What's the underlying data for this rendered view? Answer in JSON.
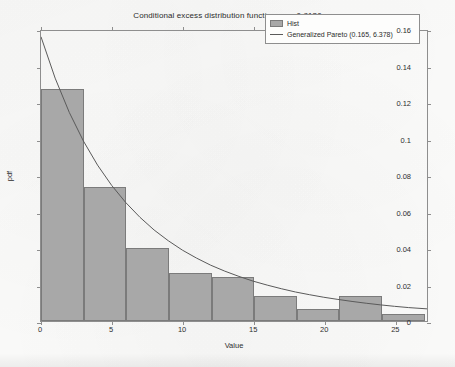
{
  "chart_data": {
    "type": "bar",
    "title_main": "Conditional excess distribution function, p",
    "title_subscript": "val",
    "title_tail": "=0.8130",
    "xlabel": "Value",
    "ylabel": "pdf",
    "xlim": [
      0,
      27.3
    ],
    "ylim": [
      0,
      0.16
    ],
    "xticks": [
      0,
      5,
      10,
      15,
      20,
      25
    ],
    "xtick_labels": [
      "0",
      "5",
      "10",
      "15",
      "20",
      "25"
    ],
    "yticks": [
      0,
      0.02,
      0.04,
      0.06,
      0.08,
      0.1,
      0.12,
      0.14,
      0.16
    ],
    "ytick_labels": [
      "0",
      "0.02",
      "0.04",
      "0.06",
      "0.08",
      "0.1",
      "0.12",
      "0.14",
      "0.16"
    ],
    "grid": false,
    "legend_position": "top-right",
    "bin_width": 3,
    "categories": [
      "0-3",
      "3-6",
      "6-9",
      "9-12",
      "12-15",
      "15-18",
      "18-21",
      "21-24",
      "24-27"
    ],
    "bin_edges": [
      0,
      3,
      6,
      9,
      12,
      15,
      18,
      21,
      24,
      27
    ],
    "values": [
      0.127,
      0.0735,
      0.04,
      0.0265,
      0.024,
      0.0135,
      0.0067,
      0.0135,
      0.004
    ],
    "series": [
      {
        "name": "Hist",
        "type": "bar",
        "color": "#a8a8a8",
        "edge_color": "#7b7b7b",
        "values": [
          0.127,
          0.0735,
          0.04,
          0.0265,
          0.024,
          0.0135,
          0.0067,
          0.0135,
          0.004
        ]
      },
      {
        "name": "Generalized Pareto (0.165, 6.378)",
        "type": "line",
        "color": "#5a5a5a",
        "shape_k": 0.165,
        "scale_sigma": 6.378,
        "x": [
          0,
          1,
          2,
          3,
          4,
          5,
          6,
          7,
          8,
          9,
          10,
          11,
          12,
          13,
          14,
          15,
          16,
          17,
          18,
          19,
          20,
          21,
          22,
          23,
          24,
          25,
          26,
          27.3
        ],
        "y": [
          0.1568,
          0.134,
          0.1151,
          0.0993,
          0.086,
          0.0748,
          0.0653,
          0.0572,
          0.0502,
          0.0443,
          0.0391,
          0.0347,
          0.0308,
          0.0275,
          0.0246,
          0.022,
          0.0198,
          0.0178,
          0.016,
          0.0145,
          0.0131,
          0.0119,
          0.0108,
          0.0098,
          0.0089,
          0.0081,
          0.0074,
          0.0067
        ]
      }
    ],
    "legend": [
      {
        "label": "Hist",
        "marker": "box",
        "color": "#a8a8a8"
      },
      {
        "label": "Generalized Pareto (0.165, 6.378)",
        "marker": "line",
        "color": "#5a5a5a"
      }
    ]
  }
}
